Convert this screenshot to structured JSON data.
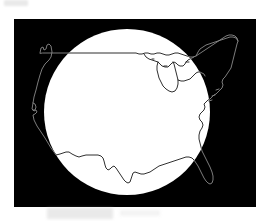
{
  "figure": {
    "title": "Contiguous United States outline over a white circle on a black rectangular field",
    "caption": "",
    "canvas": {
      "width": 267,
      "height": 221,
      "background": "#ffffff"
    }
  },
  "elements": {
    "frame": {
      "name": "black-field",
      "shape": "rectangle",
      "x": 14,
      "y": 19,
      "width": 242,
      "height": 188,
      "fill": "#000000"
    },
    "circle": {
      "name": "white-circle",
      "shape": "circle",
      "cx": 127,
      "cy": 112,
      "r": 83,
      "fill": "#ffffff"
    },
    "map": {
      "name": "usa-outline",
      "region": "Contiguous United States",
      "stroke_on_white": "#171717",
      "stroke_on_black": "#8a8a8a",
      "stroke_width": 0.9,
      "fill": "none"
    }
  },
  "colors": {
    "black": "#000000",
    "white": "#ffffff",
    "outline_dark": "#171717",
    "outline_light": "#8a8a8a",
    "smudge_gray": "#d8d8d8"
  },
  "artifacts": [
    {
      "name": "scan-smudge-top-left",
      "x": 4,
      "y": 0,
      "width": 24,
      "height": 6
    },
    {
      "name": "scan-smudge-bottom-left",
      "x": 47,
      "y": 208,
      "width": 66,
      "height": 11
    },
    {
      "name": "scan-smudge-bottom-right",
      "x": 120,
      "y": 210,
      "width": 40,
      "height": 6
    }
  ],
  "geography": {
    "features_visible": [
      "Puget Sound notch (Washington)",
      "Pacific coast (Oregon and California)",
      "San Francisco Bay notch",
      "US-Mexico border stepped line",
      "Gulf of Mexico coastline",
      "Texas southern tip",
      "Florida peninsula",
      "Atlantic seaboard",
      "Chesapeake Bay",
      "Long Island and Cape Cod",
      "Maine",
      "Great Lakes (Superior, Michigan, Huron, Erie, Ontario)",
      "49th parallel northern border"
    ]
  }
}
